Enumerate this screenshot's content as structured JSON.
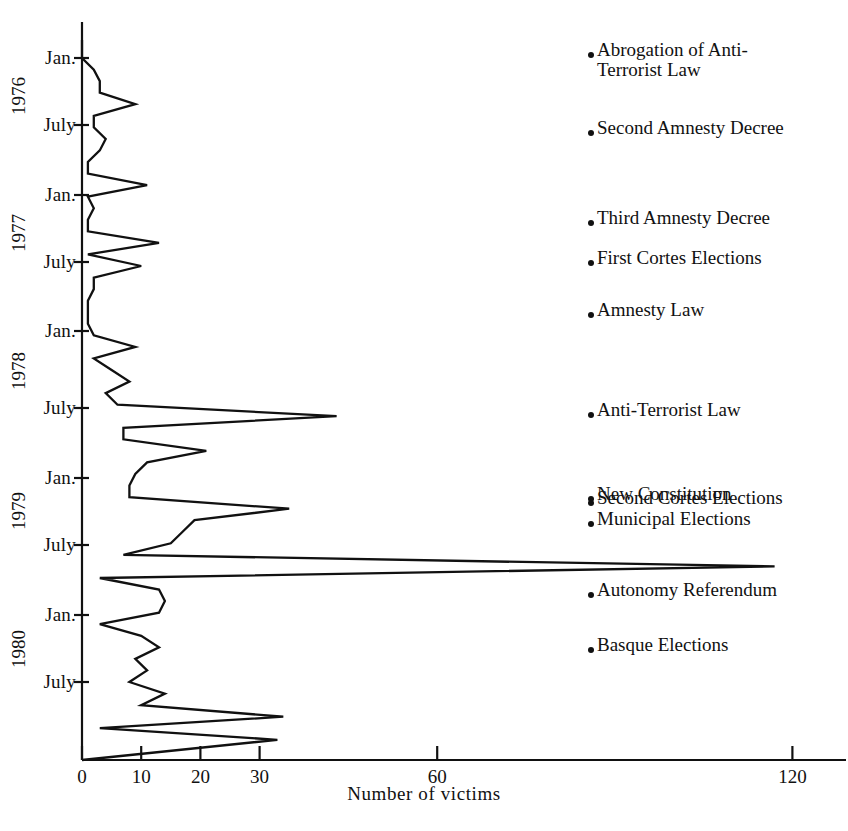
{
  "chart_data": {
    "type": "line",
    "orientation": "horizontal",
    "title": "",
    "xlabel": "Number of victims",
    "ylabel": "",
    "xlim": [
      0,
      130
    ],
    "xticks": [
      0,
      10,
      20,
      30,
      60,
      120
    ],
    "xtick_labels": [
      "0",
      "10",
      "20",
      "30",
      "60",
      "120"
    ],
    "grid": false,
    "legend": "none",
    "ytick_labels": [
      "Jan.",
      "July",
      "Jan.",
      "July",
      "Jan.",
      "July",
      "Jan.",
      "July",
      "Jan.",
      "July"
    ],
    "year_labels": [
      "1976",
      "1977",
      "1978",
      "1979",
      "1980"
    ],
    "x": [
      "1976-01",
      "1976-02",
      "1976-03",
      "1976-04",
      "1976-05",
      "1976-06",
      "1976-07",
      "1976-08",
      "1976-09",
      "1976-10",
      "1976-11",
      "1976-12",
      "1977-01",
      "1977-02",
      "1977-03",
      "1977-04",
      "1977-05",
      "1977-06",
      "1977-07",
      "1977-08",
      "1977-09",
      "1977-10",
      "1977-11",
      "1977-12",
      "1978-01",
      "1978-02",
      "1978-03",
      "1978-04",
      "1978-05",
      "1978-06",
      "1978-07",
      "1978-08",
      "1978-09",
      "1978-10",
      "1978-11",
      "1978-12",
      "1979-01",
      "1979-02",
      "1979-03",
      "1979-04",
      "1979-05",
      "1979-06",
      "1979-07",
      "1979-08",
      "1979-09",
      "1979-10",
      "1979-11",
      "1979-12",
      "1980-01",
      "1980-02",
      "1980-03",
      "1980-04",
      "1980-05",
      "1980-06",
      "1980-07",
      "1980-08",
      "1980-09",
      "1980-10",
      "1980-11",
      "1980-12"
    ],
    "values": [
      0,
      2,
      3,
      3,
      9,
      2,
      2,
      4,
      3,
      1,
      1,
      11,
      1,
      2,
      1,
      1,
      13,
      1,
      10,
      2,
      2,
      1,
      1,
      1,
      2,
      9,
      2,
      5,
      8,
      4,
      6,
      43,
      7,
      7,
      21,
      11,
      9,
      8,
      8,
      35,
      19,
      17,
      15,
      7,
      117,
      3,
      13,
      14,
      13,
      3,
      10,
      13,
      9,
      11,
      8,
      14,
      10,
      34,
      3,
      33
    ],
    "series_name": "Number of victims",
    "line_color": "#111111"
  },
  "axis": {
    "x_title": "Number of victims"
  },
  "events": [
    {
      "id": "abrogation-anti-terrorist-law",
      "label": "Abrogation of Anti-\nTerrorist Law"
    },
    {
      "id": "second-amnesty-decree",
      "label": "Second Amnesty Decree"
    },
    {
      "id": "third-amnesty-decree",
      "label": "Third Amnesty Decree"
    },
    {
      "id": "first-cortes-elections",
      "label": "First Cortes Elections"
    },
    {
      "id": "amnesty-law",
      "label": "Amnesty Law"
    },
    {
      "id": "anti-terrorist-law",
      "label": "Anti-Terrorist Law"
    },
    {
      "id": "new-constitution",
      "label": "New Constitution"
    },
    {
      "id": "second-cortes-elections",
      "label": "Second Cortes Elections"
    },
    {
      "id": "municipal-elections",
      "label": "Municipal Elections"
    },
    {
      "id": "autonomy-referendum",
      "label": "Autonomy Referendum"
    },
    {
      "id": "basque-elections",
      "label": "Basque Elections"
    }
  ]
}
